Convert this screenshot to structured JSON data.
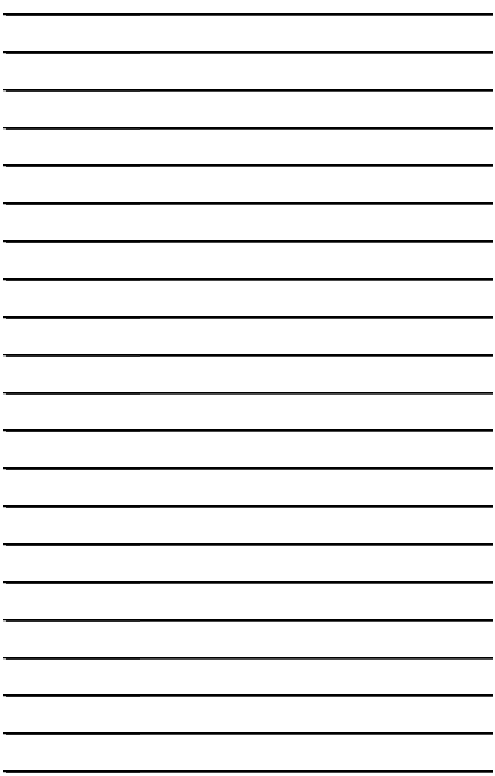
{
  "page": {
    "kind": "lined-notebook-paper",
    "width": 495,
    "height": 776,
    "background_color": "#ffffff",
    "has_text": false,
    "text_content": ""
  },
  "ruling": {
    "line_count": 21,
    "first_line_y": 13,
    "last_line_y": 770,
    "line_spacing": 37.85,
    "line_start_x": 3,
    "line_end_x": 493,
    "line_thickness": 1.3,
    "line_color_left": "#262626",
    "line_color_right": "#4a4a4a",
    "left_segment_end_x": 140,
    "tip_color": "#b9b9b9",
    "orientation": "horizontal",
    "margin_rule": false,
    "label": "horizontal ruled lines"
  },
  "lines": [
    {
      "index": 1,
      "y": 13.0,
      "label": "ruled-line-1"
    },
    {
      "index": 2,
      "y": 50.9,
      "label": "ruled-line-2"
    },
    {
      "index": 3,
      "y": 88.7,
      "label": "ruled-line-3"
    },
    {
      "index": 4,
      "y": 126.6,
      "label": "ruled-line-4"
    },
    {
      "index": 5,
      "y": 164.4,
      "label": "ruled-line-5"
    },
    {
      "index": 6,
      "y": 202.3,
      "label": "ruled-line-6"
    },
    {
      "index": 7,
      "y": 240.1,
      "label": "ruled-line-7"
    },
    {
      "index": 8,
      "y": 278.0,
      "label": "ruled-line-8"
    },
    {
      "index": 9,
      "y": 315.8,
      "label": "ruled-line-9"
    },
    {
      "index": 10,
      "y": 353.7,
      "label": "ruled-line-10"
    },
    {
      "index": 11,
      "y": 391.5,
      "label": "ruled-line-11"
    },
    {
      "index": 12,
      "y": 429.4,
      "label": "ruled-line-12"
    },
    {
      "index": 13,
      "y": 467.2,
      "label": "ruled-line-13"
    },
    {
      "index": 14,
      "y": 505.1,
      "label": "ruled-line-14"
    },
    {
      "index": 15,
      "y": 542.9,
      "label": "ruled-line-15"
    },
    {
      "index": 16,
      "y": 580.8,
      "label": "ruled-line-16"
    },
    {
      "index": 17,
      "y": 618.6,
      "label": "ruled-line-17"
    },
    {
      "index": 18,
      "y": 656.5,
      "label": "ruled-line-18"
    },
    {
      "index": 19,
      "y": 694.3,
      "label": "ruled-line-19"
    },
    {
      "index": 20,
      "y": 732.2,
      "label": "ruled-line-20"
    },
    {
      "index": 21,
      "y": 770.0,
      "label": "ruled-line-21"
    }
  ]
}
